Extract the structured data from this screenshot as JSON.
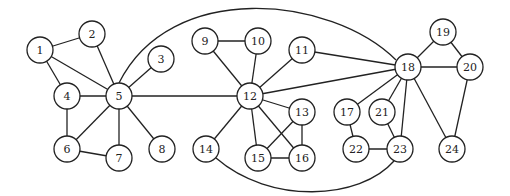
{
  "diagram": {
    "type": "undirected-graph",
    "node_radius": 13,
    "colors": {
      "stroke": "#222222",
      "fill": "#ffffff",
      "text": "#222222"
    },
    "nodes": [
      {
        "id": "1",
        "label": "1",
        "x": 40,
        "y": 50
      },
      {
        "id": "2",
        "label": "2",
        "x": 92,
        "y": 34
      },
      {
        "id": "3",
        "label": "3",
        "x": 161,
        "y": 59
      },
      {
        "id": "4",
        "label": "4",
        "x": 67,
        "y": 96
      },
      {
        "id": "5",
        "label": "5",
        "x": 119,
        "y": 96
      },
      {
        "id": "6",
        "label": "6",
        "x": 67,
        "y": 149
      },
      {
        "id": "7",
        "label": "7",
        "x": 119,
        "y": 158
      },
      {
        "id": "8",
        "label": "8",
        "x": 162,
        "y": 149
      },
      {
        "id": "9",
        "label": "9",
        "x": 205,
        "y": 41
      },
      {
        "id": "10",
        "label": "10",
        "x": 258,
        "y": 41
      },
      {
        "id": "11",
        "label": "11",
        "x": 302,
        "y": 50
      },
      {
        "id": "12",
        "label": "12",
        "x": 250,
        "y": 96
      },
      {
        "id": "13",
        "label": "13",
        "x": 302,
        "y": 112
      },
      {
        "id": "14",
        "label": "14",
        "x": 206,
        "y": 149
      },
      {
        "id": "15",
        "label": "15",
        "x": 258,
        "y": 158
      },
      {
        "id": "16",
        "label": "16",
        "x": 302,
        "y": 158
      },
      {
        "id": "17",
        "label": "17",
        "x": 347,
        "y": 112
      },
      {
        "id": "18",
        "label": "18",
        "x": 408,
        "y": 67
      },
      {
        "id": "19",
        "label": "19",
        "x": 443,
        "y": 32
      },
      {
        "id": "20",
        "label": "20",
        "x": 470,
        "y": 67
      },
      {
        "id": "21",
        "label": "21",
        "x": 382,
        "y": 112
      },
      {
        "id": "22",
        "label": "22",
        "x": 356,
        "y": 149
      },
      {
        "id": "23",
        "label": "23",
        "x": 400,
        "y": 149
      },
      {
        "id": "24",
        "label": "24",
        "x": 452,
        "y": 149
      }
    ],
    "edges": [
      {
        "from": "1",
        "to": "2"
      },
      {
        "from": "1",
        "to": "4"
      },
      {
        "from": "1",
        "to": "5"
      },
      {
        "from": "2",
        "to": "5"
      },
      {
        "from": "3",
        "to": "5"
      },
      {
        "from": "4",
        "to": "5"
      },
      {
        "from": "4",
        "to": "6"
      },
      {
        "from": "5",
        "to": "6"
      },
      {
        "from": "5",
        "to": "7"
      },
      {
        "from": "5",
        "to": "8"
      },
      {
        "from": "6",
        "to": "7"
      },
      {
        "from": "5",
        "to": "12"
      },
      {
        "from": "5",
        "to": "18",
        "curve": "M119,83 C170,-20 330,-5 396,60"
      },
      {
        "from": "9",
        "to": "10"
      },
      {
        "from": "9",
        "to": "12"
      },
      {
        "from": "10",
        "to": "12"
      },
      {
        "from": "11",
        "to": "12"
      },
      {
        "from": "11",
        "to": "18"
      },
      {
        "from": "12",
        "to": "18"
      },
      {
        "from": "12",
        "to": "13"
      },
      {
        "from": "12",
        "to": "14"
      },
      {
        "from": "12",
        "to": "15"
      },
      {
        "from": "12",
        "to": "16"
      },
      {
        "from": "13",
        "to": "15"
      },
      {
        "from": "13",
        "to": "16"
      },
      {
        "from": "15",
        "to": "16"
      },
      {
        "from": "14",
        "to": "23",
        "curve": "M216,158 C270,205 360,200 394,161"
      },
      {
        "from": "17",
        "to": "18"
      },
      {
        "from": "17",
        "to": "22"
      },
      {
        "from": "18",
        "to": "19"
      },
      {
        "from": "18",
        "to": "20"
      },
      {
        "from": "18",
        "to": "21"
      },
      {
        "from": "18",
        "to": "23"
      },
      {
        "from": "18",
        "to": "24"
      },
      {
        "from": "19",
        "to": "20"
      },
      {
        "from": "20",
        "to": "24"
      },
      {
        "from": "21",
        "to": "23"
      },
      {
        "from": "22",
        "to": "23"
      }
    ]
  }
}
